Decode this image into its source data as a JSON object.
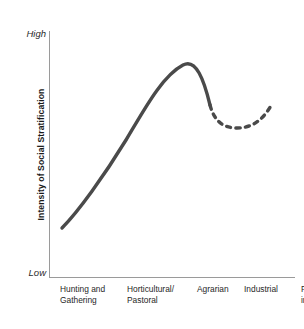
{
  "chart": {
    "y_axis": {
      "title": "Intensity of Social Stratification",
      "high_label": "High",
      "low_label": "Low"
    },
    "categories": [
      {
        "label": "Hunting and\nGathering",
        "left": 11
      },
      {
        "label": "Horticultural/\nPastoral",
        "left": 78
      },
      {
        "label": "Agrarian",
        "left": 148
      },
      {
        "label": "Industrial",
        "left": 195
      },
      {
        "label": "Post-\nindustrial",
        "left": 252
      }
    ],
    "colors": {
      "curve": "#4a4a4a",
      "axis": "#9a9a9a",
      "text": "#1f1f1f",
      "background": "#ffffff"
    },
    "curve": {
      "solid_path": "M 62 228 C 78 212 104 176 126 140 C 144 110 162 76 183 65 C 196 58 204 80 210 105",
      "dashed_path": "M 210 105 C 214 120 222 128 237 128 C 254 128 264 118 272 104",
      "stroke_width": 3.4,
      "dash_pattern": "4.2 5.2"
    }
  },
  "chart_data": {
    "type": "line",
    "title": "",
    "xlabel": "",
    "ylabel": "Intensity of Social Stratification",
    "ylim": [
      0,
      100
    ],
    "ytick_labels": [
      "Low",
      "High"
    ],
    "grid": false,
    "legend": "none",
    "categories": [
      "Hunting and Gathering",
      "Horticultural/Pastoral",
      "Agrarian",
      "Industrial",
      "Post-industrial"
    ],
    "series": [
      {
        "name": "Intensity of social stratification",
        "style": "solid",
        "values": [
          20,
          55,
          86,
          70,
          null
        ],
        "note": "Solid curve rises from low among hunter-gatherers, peaks between horticultural/pastoral and agrarian societies, then declines into the industrial stage."
      },
      {
        "name": "Industrial to post-industrial trend",
        "style": "dashed",
        "values": [
          null,
          null,
          null,
          70,
          72
        ],
        "note": "Dashed segment dips to a minimum early in the industrial/post-industrial transition (about 61) then rises slightly toward the post-industrial stage."
      }
    ],
    "annotations": [
      "Curve peaks near the agrarian stage",
      "Dashed portion indicates projected or uncertain trend after the industrial stage"
    ]
  }
}
